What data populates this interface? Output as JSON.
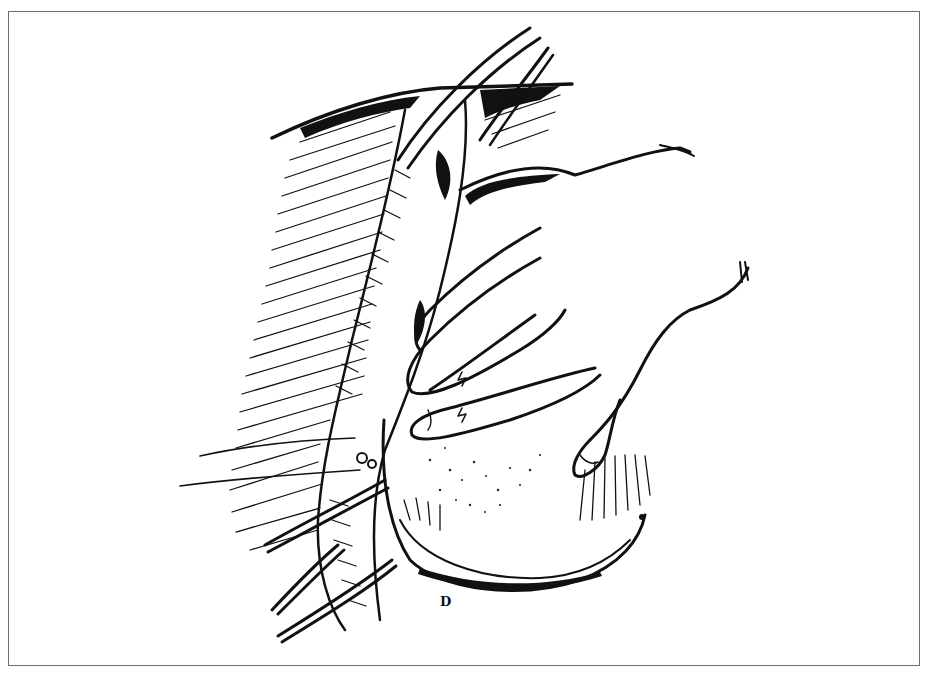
{
  "figure": {
    "type": "medical line illustration",
    "style": "black-and-white pen-and-ink with hatching and stippling",
    "signature": "D",
    "frame": {
      "border_color": "#6e6e6e",
      "background": "#ffffff",
      "ink_color": "#111111"
    },
    "caption_partially_visible": true
  },
  "elements": {
    "hand": "hand-retracting-organ",
    "organ": "stippled-organ",
    "clamps": [
      "upper-forceps",
      "lower-forceps-1",
      "lower-forceps-2"
    ],
    "sutures": [
      "suture-1",
      "suture-2"
    ],
    "tissue": "hatched-tissue-left"
  }
}
